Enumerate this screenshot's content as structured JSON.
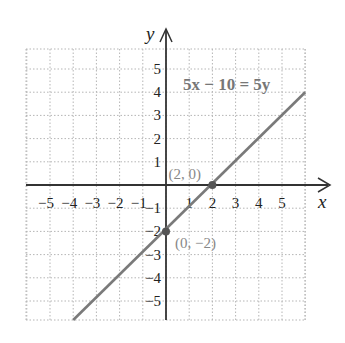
{
  "chart_data": {
    "type": "line",
    "title": "",
    "equation_label": "5x − 10 = 5y",
    "xlabel": "x",
    "ylabel": "y",
    "xlim": [
      -6,
      6
    ],
    "ylim": [
      -6,
      6
    ],
    "grid": true,
    "grid_style": "dotted",
    "x_ticks": [
      -5,
      -4,
      -3,
      -2,
      -1,
      1,
      2,
      3,
      4,
      5
    ],
    "y_ticks": [
      5,
      4,
      3,
      2,
      1,
      -1,
      -2,
      -3,
      -4,
      -5
    ],
    "x_tick_labels": [
      "−5",
      "−4",
      "−3",
      "−2",
      "−1",
      "1",
      "2",
      "3",
      "4",
      "5"
    ],
    "y_tick_labels": [
      "5",
      "4",
      "3",
      "2",
      "1",
      "−1",
      "−2",
      "−3",
      "−4",
      "−5"
    ],
    "series": [
      {
        "name": "5x − 10 = 5y",
        "slope": 1,
        "intercept": -2,
        "x": [
          -4,
          6
        ],
        "y": [
          -6,
          4
        ],
        "color": "#7a7a7a"
      }
    ],
    "points": [
      {
        "x": 2,
        "y": 0,
        "label": "(2, 0)"
      },
      {
        "x": 0,
        "y": -2,
        "label": "(0, −2)"
      }
    ]
  },
  "colors": {
    "axis": "#333333",
    "grid": "#b5b5b5",
    "line": "#7a7a7a",
    "point": "#555555",
    "equation": "#777777"
  }
}
